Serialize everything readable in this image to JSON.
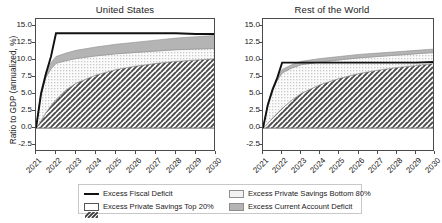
{
  "figure": {
    "ylabel": "Ratio to GDP (annualized, %)",
    "yticks": [
      "-2.5",
      "0.0",
      "2.5",
      "5.0",
      "7.5",
      "10.0",
      "12.5",
      "15.0"
    ],
    "ytick_values": [
      -2.5,
      0,
      2.5,
      5,
      7.5,
      10,
      12.5,
      15
    ],
    "xticks": [
      "2021",
      "2022",
      "2023",
      "2024",
      "2025",
      "2026",
      "2027",
      "2028",
      "2029",
      "2030"
    ],
    "colors": {
      "line": "#111111",
      "top20_hatch": "#4a4a4a",
      "bottom80_dots": "#f0f0f0",
      "current_account_gray": "#b4b4b4",
      "frame": "#4a4a4a",
      "legend_border": "#c8c8c8"
    }
  },
  "legend": {
    "items": [
      {
        "label": "Excess Fiscal Deficit",
        "swatch": "line"
      },
      {
        "label": "Excess Private Savings Bottom 80%",
        "swatch": "dots"
      },
      {
        "label": "Excess Private Savings Top 20%",
        "swatch": "hatch"
      },
      {
        "label": "Excess Current Account Deficit",
        "swatch": "gray"
      }
    ]
  },
  "chart_data": {
    "type": "area",
    "title": "",
    "xlabel": "",
    "ylabel": "Ratio to GDP (annualized, %)",
    "ylim": [
      -3.5,
      16.0
    ],
    "xlim": [
      2021,
      2030
    ],
    "grid": false,
    "legend_position": "bottom",
    "panels": [
      {
        "title": "United States",
        "x": [
          2021,
          2021.25,
          2021.5,
          2021.75,
          2022,
          2022.5,
          2023,
          2024,
          2025,
          2026,
          2027,
          2028,
          2029,
          2030
        ],
        "series": [
          {
            "name": "Excess Private Savings Top 20%",
            "type": "stacked-area",
            "pattern": "hatch",
            "values": [
              0.0,
              1.1,
              2.3,
              3.3,
              4.2,
              5.6,
              6.6,
              7.8,
              8.6,
              9.1,
              9.5,
              9.8,
              10.0,
              10.2
            ]
          },
          {
            "name": "Excess Private Savings Bottom 80%",
            "type": "stacked-area",
            "pattern": "dots",
            "values": [
              0.0,
              3.9,
              5.2,
              5.4,
              5.3,
              4.3,
              3.6,
              2.8,
              2.3,
              2.0,
              1.8,
              1.7,
              1.6,
              1.5
            ]
          },
          {
            "name": "Excess Current Account Deficit",
            "type": "stacked-area",
            "pattern": "solid-gray",
            "values": [
              0.0,
              0.5,
              0.8,
              0.9,
              1.0,
              1.1,
              1.2,
              1.3,
              1.4,
              1.5,
              1.6,
              1.7,
              1.8,
              1.9
            ]
          },
          {
            "name": "Excess Fiscal Deficit",
            "type": "line",
            "values": [
              0.0,
              5.0,
              8.0,
              10.5,
              13.9,
              13.9,
              13.9,
              13.9,
              13.9,
              13.9,
              13.9,
              13.9,
              13.8,
              13.8
            ]
          }
        ]
      },
      {
        "title": "Rest of the World",
        "x": [
          2021,
          2021.25,
          2021.5,
          2021.75,
          2022,
          2022.5,
          2023,
          2024,
          2025,
          2026,
          2027,
          2028,
          2029,
          2030
        ],
        "series": [
          {
            "name": "Excess Private Savings Top 20%",
            "type": "stacked-area",
            "pattern": "hatch",
            "values": [
              0.0,
              0.7,
              1.5,
              2.2,
              2.9,
              4.1,
              5.1,
              6.4,
              7.3,
              8.0,
              8.5,
              8.9,
              9.2,
              9.5
            ]
          },
          {
            "name": "Excess Private Savings Bottom 80%",
            "type": "stacked-area",
            "pattern": "dots",
            "values": [
              0.0,
              2.7,
              4.2,
              4.8,
              5.2,
              4.7,
              4.2,
              3.3,
              2.7,
              2.3,
              2.0,
              1.8,
              1.7,
              1.6
            ]
          },
          {
            "name": "Excess Current Account Deficit",
            "type": "stacked-area",
            "pattern": "solid-gray",
            "values": [
              0.0,
              0.2,
              0.3,
              0.4,
              0.5,
              0.5,
              0.5,
              0.5,
              0.5,
              0.5,
              0.5,
              0.5,
              0.5,
              0.5
            ]
          },
          {
            "name": "Excess Fiscal Deficit",
            "type": "line",
            "values": [
              0.0,
              3.4,
              5.6,
              7.4,
              9.6,
              9.6,
              9.6,
              9.6,
              9.6,
              9.6,
              9.6,
              9.6,
              9.6,
              9.7
            ]
          }
        ]
      }
    ]
  }
}
